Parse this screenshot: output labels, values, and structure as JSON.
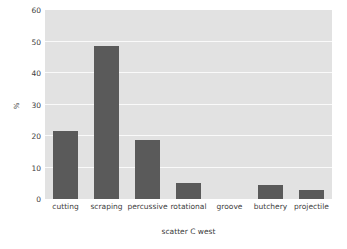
{
  "chart_data": {
    "type": "bar",
    "title": "",
    "subtitle": "",
    "xlabel": "scatter C west",
    "ylabel": "%",
    "categories": [
      "cutting",
      "scraping",
      "percussive",
      "rotational",
      "groove",
      "butchery",
      "projectile"
    ],
    "values": [
      21.7,
      48.7,
      18.6,
      5.2,
      0,
      4.3,
      3.0
    ],
    "ylim": [
      0,
      60
    ],
    "yticks": [
      0,
      10,
      20,
      30,
      40,
      50,
      60
    ],
    "ytick_labels": [
      "0",
      "10",
      "20",
      "30",
      "40",
      "50",
      "60"
    ],
    "grid": true,
    "grid_axis": "y",
    "legend": false,
    "legend_position": "none",
    "bar_color": "#5a5a5a",
    "plot_background": "#e2e2e2",
    "gridline_color": "#fafafa",
    "figure_background": "#ffffff"
  }
}
